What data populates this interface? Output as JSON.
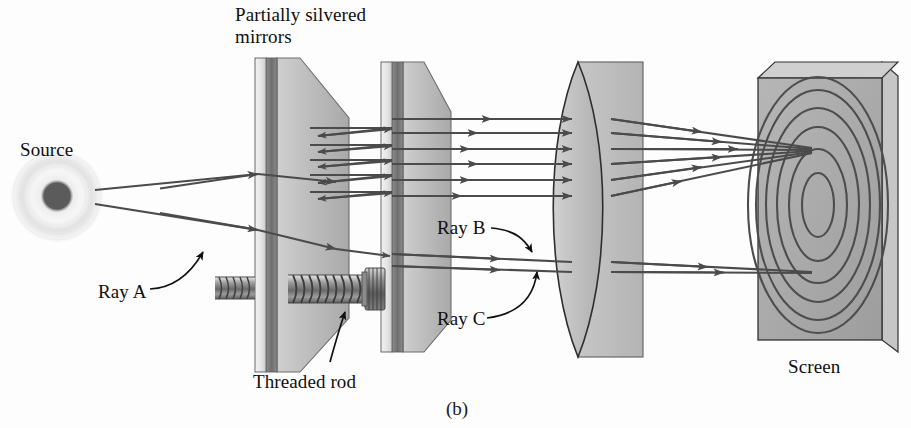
{
  "figure": {
    "caption": "(b)",
    "background_color": "#fdfdfd",
    "ray_color": "#4b4b4b",
    "glass_color": "#b9b9b9",
    "silver_color": "#7a7a7a"
  },
  "labels": {
    "mirrors_line1": "Partially silvered",
    "mirrors_line2": "mirrors",
    "source": "Source",
    "ray_a": "Ray A",
    "ray_b": "Ray B",
    "ray_c": "Ray C",
    "threaded_rod": "Threaded rod",
    "screen": "Screen"
  },
  "components": [
    {
      "name": "source",
      "label": "Source",
      "kind": "point-light-source"
    },
    {
      "name": "mirror-1",
      "label": "Partially silvered mirror",
      "kind": "partially-silvered-mirror"
    },
    {
      "name": "mirror-2",
      "label": "Partially silvered mirror",
      "kind": "partially-silvered-mirror"
    },
    {
      "name": "threaded-rod",
      "label": "Threaded rod",
      "kind": "adjustment-screw"
    },
    {
      "name": "lens",
      "label": "Converging lens",
      "kind": "biconvex-lens"
    },
    {
      "name": "screen",
      "label": "Screen",
      "kind": "projection-screen"
    }
  ],
  "rays": [
    {
      "name": "ray-a",
      "label": "Ray A",
      "description": "incident ray from source to first mirror"
    },
    {
      "name": "ray-b",
      "label": "Ray B",
      "description": "upper transmitted ray toward lens"
    },
    {
      "name": "ray-c",
      "label": "Ray C",
      "description": "lower transmitted ray toward lens"
    }
  ],
  "interference_pattern": {
    "name": "concentric-rings",
    "ring_count": 6,
    "center_x": 818,
    "center_y": 205
  }
}
